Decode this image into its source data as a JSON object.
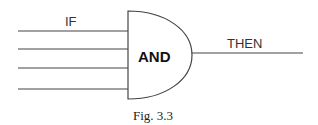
{
  "diagram": {
    "type": "logic-gate",
    "gate_label": "AND",
    "input_label": "IF",
    "output_label": "THEN",
    "input_count": 4,
    "caption": "Fig. 3.3",
    "stroke_color": "#444444"
  }
}
